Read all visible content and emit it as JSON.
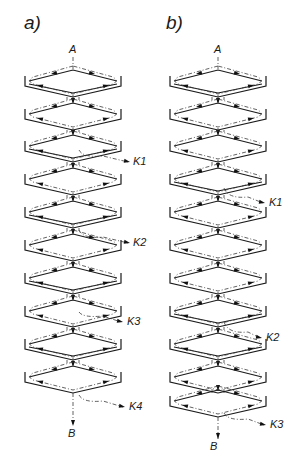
{
  "figure": {
    "panels": [
      {
        "id": "a",
        "label": "a)",
        "label_pos": [
          24,
          14
        ],
        "center_x": 73,
        "inlet": {
          "label": "A",
          "x": 73,
          "y": 49
        },
        "outlet": {
          "label": "B",
          "x": 72,
          "y": 432
        },
        "stages": [
          {
            "y": 80,
            "type": "double"
          },
          {
            "y": 113,
            "type": "single"
          },
          {
            "y": 145,
            "type": "double"
          },
          {
            "y": 178,
            "type": "single"
          },
          {
            "y": 211,
            "type": "double"
          },
          {
            "y": 244,
            "type": "single"
          },
          {
            "y": 277,
            "type": "double"
          },
          {
            "y": 310,
            "type": "single"
          },
          {
            "y": 343,
            "type": "double"
          },
          {
            "y": 376,
            "type": "single"
          }
        ],
        "side_streams": [
          {
            "label": "K1",
            "from_y": 150,
            "to_x": 130,
            "to_y": 162
          },
          {
            "label": "K2",
            "from_y": 230,
            "to_x": 130,
            "to_y": 243
          },
          {
            "label": "K3",
            "from_y": 312,
            "to_x": 123,
            "to_y": 322
          },
          {
            "label": "K4",
            "from_y": 395,
            "to_x": 125,
            "to_y": 407
          }
        ]
      },
      {
        "id": "b",
        "label": "b)",
        "label_pos": [
          166,
          14
        ],
        "center_x": 218,
        "inlet": {
          "label": "A",
          "x": 218,
          "y": 49
        },
        "outlet": {
          "label": "B",
          "x": 214,
          "y": 445
        },
        "stages": [
          {
            "y": 80,
            "type": "double"
          },
          {
            "y": 113,
            "type": "single"
          },
          {
            "y": 145,
            "type": "single"
          },
          {
            "y": 178,
            "type": "double"
          },
          {
            "y": 211,
            "type": "single"
          },
          {
            "y": 244,
            "type": "single"
          },
          {
            "y": 277,
            "type": "single"
          },
          {
            "y": 310,
            "type": "double"
          },
          {
            "y": 343,
            "type": "double"
          },
          {
            "y": 376,
            "type": "single"
          },
          {
            "y": 400,
            "type": "single"
          }
        ],
        "side_streams": [
          {
            "label": "K1",
            "from_y": 188,
            "to_x": 265,
            "to_y": 203
          },
          {
            "label": "K2",
            "from_y": 322,
            "to_x": 262,
            "to_y": 338
          },
          {
            "label": "K3",
            "from_y": 413,
            "to_x": 266,
            "to_y": 425
          }
        ]
      }
    ]
  },
  "icons": {
    "flow-arrow": "filled-triangle"
  }
}
